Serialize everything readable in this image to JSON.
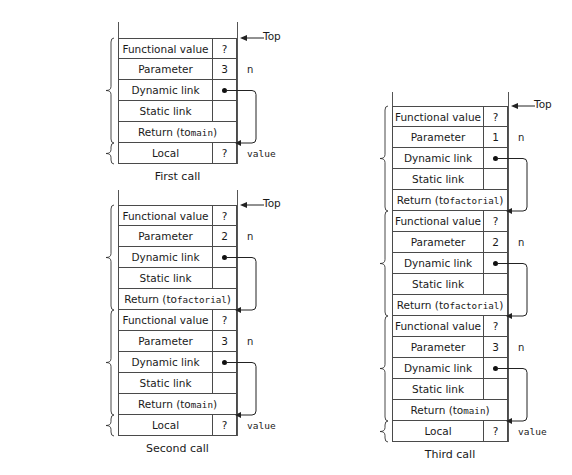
{
  "figure": {
    "labels": {
      "top": "Top",
      "n": "n",
      "value": "value",
      "question": "?",
      "functional_value": "Functional value",
      "parameter": "Parameter",
      "dynamic_link": "Dynamic link",
      "static_link": "Static link",
      "local": "Local",
      "return_to_main": "Return (to main)",
      "return_to_factorial_pre": "Return (to",
      "return_to_factorial_fn": "factorial",
      "return_to_factorial_post": ")",
      "ari_for_label": "ARI",
      "for_word": "for",
      "main_fn": "main",
      "factorial_fn": "factorial"
    },
    "diagrams": [
      {
        "id": "first-call",
        "caption": "First call",
        "frames": [
          {
            "brace_line1": "First ARI",
            "brace_line2_prefix": "for ",
            "brace_line2_fn": "factorial",
            "rows": [
              {
                "label": "Functional value",
                "value": "?",
                "kind": "plain",
                "right": ""
              },
              {
                "label": "Parameter",
                "value": "3",
                "kind": "plain",
                "right": "n"
              },
              {
                "label": "Dynamic link",
                "value": "dot",
                "kind": "plain",
                "right": ""
              },
              {
                "label": "Static link",
                "value": "",
                "kind": "plain",
                "right": ""
              },
              {
                "label": "Return (to main)",
                "value": "",
                "kind": "full-main",
                "right": ""
              }
            ]
          },
          {
            "brace_line1": "ARI",
            "brace_line2_prefix": "for ",
            "brace_line2_fn": "main",
            "rows": [
              {
                "label": "Local",
                "value": "?",
                "kind": "plain",
                "right": "value"
              }
            ]
          }
        ]
      },
      {
        "id": "second-call",
        "caption": "Second call",
        "frames": [
          {
            "brace_line1": "Second ARI",
            "brace_line2_prefix": "for ",
            "brace_line2_fn": "factorial",
            "rows": [
              {
                "label": "Functional value",
                "value": "?",
                "kind": "plain",
                "right": ""
              },
              {
                "label": "Parameter",
                "value": "2",
                "kind": "plain",
                "right": "n"
              },
              {
                "label": "Dynamic link",
                "value": "dot",
                "kind": "plain",
                "right": ""
              },
              {
                "label": "Static link",
                "value": "",
                "kind": "plain",
                "right": ""
              },
              {
                "label": "Return (to factorial)",
                "value": "",
                "kind": "full-fact",
                "right": ""
              }
            ]
          },
          {
            "brace_line1": "First ARI",
            "brace_line2_prefix": "for ",
            "brace_line2_fn": "factorial",
            "rows": [
              {
                "label": "Functional value",
                "value": "?",
                "kind": "plain",
                "right": ""
              },
              {
                "label": "Parameter",
                "value": "3",
                "kind": "plain",
                "right": "n"
              },
              {
                "label": "Dynamic link",
                "value": "dot",
                "kind": "plain",
                "right": ""
              },
              {
                "label": "Static link",
                "value": "",
                "kind": "plain",
                "right": ""
              },
              {
                "label": "Return (to main)",
                "value": "",
                "kind": "full-main",
                "right": ""
              }
            ]
          },
          {
            "brace_line1": "ARI",
            "brace_line2_prefix": "for ",
            "brace_line2_fn": "main",
            "rows": [
              {
                "label": "Local",
                "value": "?",
                "kind": "plain",
                "right": "value"
              }
            ]
          }
        ]
      },
      {
        "id": "third-call",
        "caption": "Third call",
        "frames": [
          {
            "brace_line1": "Third ARI",
            "brace_line2_prefix": "for ",
            "brace_line2_fn": "factorial",
            "rows": [
              {
                "label": "Functional value",
                "value": "?",
                "kind": "plain",
                "right": ""
              },
              {
                "label": "Parameter",
                "value": "1",
                "kind": "plain",
                "right": "n"
              },
              {
                "label": "Dynamic link",
                "value": "dot",
                "kind": "plain",
                "right": ""
              },
              {
                "label": "Static link",
                "value": "",
                "kind": "plain",
                "right": ""
              },
              {
                "label": "Return (to factorial)",
                "value": "",
                "kind": "full-fact",
                "right": ""
              }
            ]
          },
          {
            "brace_line1": "Second ARI",
            "brace_line2_prefix": "for ",
            "brace_line2_fn": "factorial",
            "rows": [
              {
                "label": "Functional value",
                "value": "?",
                "kind": "plain",
                "right": ""
              },
              {
                "label": "Parameter",
                "value": "2",
                "kind": "plain",
                "right": "n"
              },
              {
                "label": "Dynamic link",
                "value": "dot",
                "kind": "plain",
                "right": ""
              },
              {
                "label": "Static link",
                "value": "",
                "kind": "plain",
                "right": ""
              },
              {
                "label": "Return (to factorial)",
                "value": "",
                "kind": "full-fact",
                "right": ""
              }
            ]
          },
          {
            "brace_line1": "First ARI",
            "brace_line2_prefix": "for ",
            "brace_line2_fn": "factorial",
            "rows": [
              {
                "label": "Functional value",
                "value": "?",
                "kind": "plain",
                "right": ""
              },
              {
                "label": "Parameter",
                "value": "3",
                "kind": "plain",
                "right": "n"
              },
              {
                "label": "Dynamic link",
                "value": "dot",
                "kind": "plain",
                "right": ""
              },
              {
                "label": "Static link",
                "value": "",
                "kind": "plain",
                "right": ""
              },
              {
                "label": "Return (to main)",
                "value": "",
                "kind": "full-main",
                "right": ""
              }
            ]
          },
          {
            "brace_line1": "ARI",
            "brace_line2_prefix": "for ",
            "brace_line2_fn": "main",
            "rows": [
              {
                "label": "Local",
                "value": "?",
                "kind": "plain",
                "right": "value"
              }
            ]
          }
        ]
      }
    ],
    "colors": {
      "line": "#4a4a4a",
      "rail": "#555555",
      "text": "#1a1a1a",
      "background": "#ffffff"
    }
  }
}
